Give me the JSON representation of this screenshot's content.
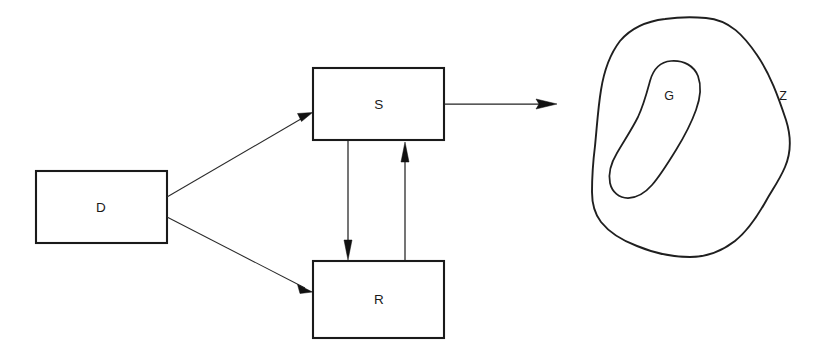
{
  "figure": {
    "kind": "block-diagram",
    "background_color": "#ffffff",
    "stroke_color": "#1a1a1a",
    "width": 822,
    "height": 360
  },
  "blocks": [
    {
      "id": "D",
      "label": "D",
      "x": 36,
      "y": 171,
      "width": 131,
      "height": 72,
      "label_x": 101,
      "label_y": 208
    },
    {
      "id": "S",
      "label": "S",
      "x": 313,
      "y": 68,
      "width": 131,
      "height": 72,
      "label_x": 379,
      "label_y": 105
    },
    {
      "id": "R",
      "label": "R",
      "x": 313,
      "y": 261,
      "width": 131,
      "height": 77,
      "label_x": 379,
      "label_y": 300
    }
  ],
  "arrows": [
    {
      "id": "D-to-S",
      "from": "D",
      "to": "S",
      "style": "diagonal",
      "x1": 167,
      "y1": 197,
      "x2": 311,
      "y2": 113
    },
    {
      "id": "D-to-R",
      "from": "D",
      "to": "R",
      "style": "diagonal",
      "x1": 167,
      "y1": 217,
      "x2": 311,
      "y2": 292
    },
    {
      "id": "S-to-R",
      "from": "S",
      "to": "R",
      "style": "vertical-down",
      "x1": 348,
      "y1": 141,
      "x2": 348,
      "y2": 259
    },
    {
      "id": "R-to-S",
      "from": "R",
      "to": "S",
      "style": "vertical-up",
      "x1": 405,
      "y1": 260,
      "x2": 405,
      "y2": 142
    },
    {
      "id": "S-output",
      "from": "S",
      "to": "Z",
      "style": "horizontal-right",
      "x1": 444,
      "y1": 104,
      "x2": 557,
      "y2": 104
    }
  ],
  "regions": [
    {
      "id": "Z",
      "label": "Z",
      "role": "outer-region",
      "label_x": 783,
      "label_y": 97
    },
    {
      "id": "G",
      "label": "G",
      "role": "inner-region",
      "label_x": 669,
      "label_y": 97
    }
  ]
}
